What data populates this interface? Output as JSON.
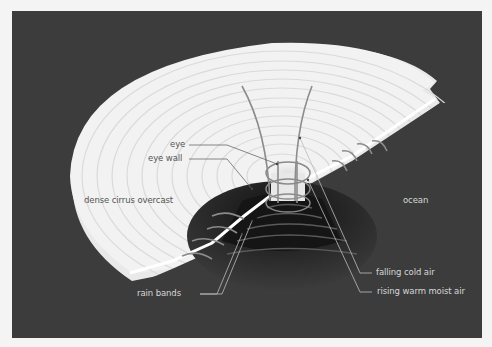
{
  "diagram": {
    "background_color": "#3c3c3c",
    "cloud_color": "#f2f2f2",
    "labels": {
      "eye": "eye",
      "eye_wall": "eye wall",
      "dense_cirrus_overcast": "dense cirrus overcast",
      "ocean": "ocean",
      "rain_bands": "rain bands",
      "falling_cold_air": "falling cold air",
      "rising_warm_moist_air": "rising warm moist air"
    }
  }
}
